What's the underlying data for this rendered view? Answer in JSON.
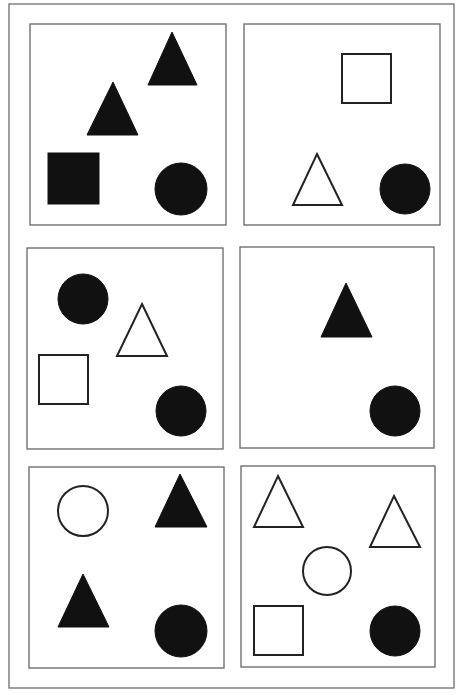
{
  "colors": {
    "background": "#ffffff",
    "frame_stroke": "#6e6e6e",
    "panel_stroke": "#666666",
    "shape_fill": "#111111",
    "shape_stroke": "#222222"
  },
  "frame": {
    "x": 9,
    "y": 4,
    "w": 445,
    "h": 684
  },
  "panels": [
    {
      "id": "panel-1",
      "x": 30,
      "y": 24,
      "w": 196,
      "h": 201,
      "shapes": [
        {
          "type": "triangle",
          "fill": "solid",
          "apex": [
            172,
            32
          ],
          "base": [
            [
              148,
              85
            ],
            [
              197,
              85
            ]
          ]
        },
        {
          "type": "triangle",
          "fill": "solid",
          "apex": [
            113,
            82
          ],
          "base": [
            [
              87,
              135
            ],
            [
              138,
              135
            ]
          ]
        },
        {
          "type": "square",
          "fill": "solid",
          "x": 48,
          "y": 153,
          "size": 51
        },
        {
          "type": "circle",
          "fill": "solid",
          "cx": 181,
          "cy": 189,
          "r": 26
        }
      ]
    },
    {
      "id": "panel-2",
      "x": 244,
      "y": 24,
      "w": 196,
      "h": 201,
      "shapes": [
        {
          "type": "square",
          "fill": "outline",
          "x": 342,
          "y": 54,
          "size": 49
        },
        {
          "type": "triangle",
          "fill": "outline",
          "apex": [
            317,
            154
          ],
          "base": [
            [
              293,
              205
            ],
            [
              342,
              205
            ]
          ]
        },
        {
          "type": "circle",
          "fill": "solid",
          "cx": 405,
          "cy": 189,
          "r": 25
        }
      ]
    },
    {
      "id": "panel-3",
      "x": 27,
      "y": 248,
      "w": 196,
      "h": 201,
      "shapes": [
        {
          "type": "circle",
          "fill": "solid",
          "cx": 83,
          "cy": 299,
          "r": 25
        },
        {
          "type": "triangle",
          "fill": "outline",
          "apex": [
            142,
            304
          ],
          "base": [
            [
              117,
              356
            ],
            [
              167,
              356
            ]
          ]
        },
        {
          "type": "square",
          "fill": "outline",
          "x": 39,
          "y": 355,
          "size": 49
        },
        {
          "type": "circle",
          "fill": "solid",
          "cx": 181,
          "cy": 411,
          "r": 25
        }
      ]
    },
    {
      "id": "panel-4",
      "x": 240,
      "y": 247,
      "w": 194,
      "h": 201,
      "shapes": [
        {
          "type": "triangle",
          "fill": "solid",
          "apex": [
            346,
            283
          ],
          "base": [
            [
              321,
              337
            ],
            [
              372,
              337
            ]
          ]
        },
        {
          "type": "circle",
          "fill": "solid",
          "cx": 395,
          "cy": 411,
          "r": 25
        }
      ]
    },
    {
      "id": "panel-5",
      "x": 29,
      "y": 467,
      "w": 195,
      "h": 201,
      "shapes": [
        {
          "type": "circle",
          "fill": "outline",
          "cx": 83,
          "cy": 511,
          "r": 25
        },
        {
          "type": "triangle",
          "fill": "solid",
          "apex": [
            180,
            474
          ],
          "base": [
            [
              155,
              527
            ],
            [
              207,
              527
            ]
          ]
        },
        {
          "type": "triangle",
          "fill": "solid",
          "apex": [
            83,
            574
          ],
          "base": [
            [
              58,
              627
            ],
            [
              109,
              627
            ]
          ]
        },
        {
          "type": "circle",
          "fill": "solid",
          "cx": 181,
          "cy": 631,
          "r": 26
        }
      ]
    },
    {
      "id": "panel-6",
      "x": 241,
      "y": 466,
      "w": 194,
      "h": 201,
      "shapes": [
        {
          "type": "triangle",
          "fill": "outline",
          "apex": [
            278,
            476
          ],
          "base": [
            [
              254,
              527
            ],
            [
              303,
              527
            ]
          ]
        },
        {
          "type": "triangle",
          "fill": "outline",
          "apex": [
            394,
            496
          ],
          "base": [
            [
              370,
              547
            ],
            [
              420,
              547
            ]
          ]
        },
        {
          "type": "circle",
          "fill": "outline",
          "cx": 327,
          "cy": 571,
          "r": 24
        },
        {
          "type": "square",
          "fill": "outline",
          "x": 254,
          "y": 606,
          "size": 49
        },
        {
          "type": "circle",
          "fill": "solid",
          "cx": 395,
          "cy": 631,
          "r": 25
        }
      ]
    }
  ]
}
